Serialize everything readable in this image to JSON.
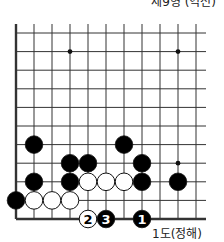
{
  "title": "제9형 (역전)",
  "caption": "1도(정해)",
  "board": {
    "origin_x": 16,
    "origin_y": 33,
    "step_x": 18,
    "step_y": 18.6,
    "cols": 11,
    "rows": 11,
    "top_y": 24,
    "right_x": 206,
    "edges": [
      "left",
      "bottom"
    ],
    "star_points": [
      [
        3,
        1
      ],
      [
        9,
        1
      ],
      [
        9,
        7
      ]
    ],
    "stones": [
      {
        "col": 1,
        "row": 6,
        "color": "black"
      },
      {
        "col": 6,
        "row": 6,
        "color": "black"
      },
      {
        "col": 3,
        "row": 7,
        "color": "black"
      },
      {
        "col": 4,
        "row": 7,
        "color": "black"
      },
      {
        "col": 7,
        "row": 7,
        "color": "black"
      },
      {
        "col": 1,
        "row": 8,
        "color": "black"
      },
      {
        "col": 3,
        "row": 8,
        "color": "black"
      },
      {
        "col": 4,
        "row": 8,
        "color": "white"
      },
      {
        "col": 5,
        "row": 8,
        "color": "white"
      },
      {
        "col": 6,
        "row": 8,
        "color": "white"
      },
      {
        "col": 7,
        "row": 8,
        "color": "black"
      },
      {
        "col": 9,
        "row": 8,
        "color": "black"
      },
      {
        "col": 0,
        "row": 9,
        "color": "black"
      },
      {
        "col": 1,
        "row": 9,
        "color": "white"
      },
      {
        "col": 2,
        "row": 9,
        "color": "white"
      },
      {
        "col": 3,
        "row": 9,
        "color": "white"
      },
      {
        "col": 4,
        "row": 10,
        "color": "white",
        "label": "2"
      },
      {
        "col": 5,
        "row": 10,
        "color": "black",
        "label": "3"
      },
      {
        "col": 7,
        "row": 10,
        "color": "black",
        "label": "1"
      }
    ]
  },
  "colors": {
    "line": "#333333",
    "black_stone": "#000000",
    "white_stone": "#ffffff"
  }
}
